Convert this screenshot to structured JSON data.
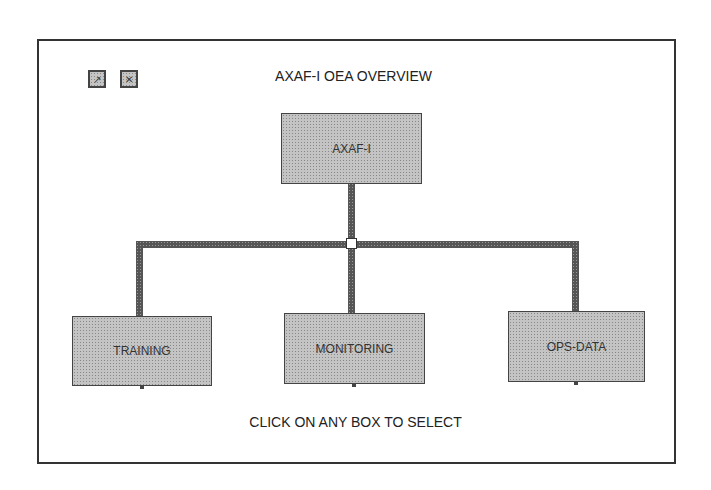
{
  "title": "AXAF-I OEA OVERVIEW",
  "toolbar": {
    "buttons": [
      {
        "icon": "up-arrow-icon",
        "glyph": "↗"
      },
      {
        "icon": "close-icon",
        "glyph": "✕"
      }
    ]
  },
  "root": {
    "label": "AXAF-I"
  },
  "children": [
    {
      "label": "TRAINING"
    },
    {
      "label": "MONITORING"
    },
    {
      "label": "OPS-DATA"
    }
  ],
  "instruction": "CLICK ON ANY BOX TO SELECT"
}
